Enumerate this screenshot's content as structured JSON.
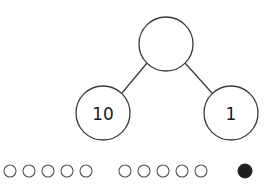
{
  "number_bond": {
    "whole": {
      "label": "",
      "cx": 166,
      "cy": 44,
      "r": 27
    },
    "parts": [
      {
        "label": "10",
        "cx": 103,
        "cy": 113,
        "r": 27
      },
      {
        "label": "1",
        "cx": 231,
        "cy": 113,
        "r": 27
      }
    ]
  },
  "counters": {
    "groups": [
      {
        "name": "ten-group-1",
        "count": 5,
        "filled": false,
        "centers_x": [
          10,
          29,
          48,
          67,
          86
        ]
      },
      {
        "name": "ten-group-2",
        "count": 5,
        "filled": false,
        "centers_x": [
          125,
          144,
          163,
          182,
          201
        ]
      },
      {
        "name": "one-group",
        "count": 1,
        "filled": true,
        "centers_x": [
          245
        ]
      }
    ],
    "cy": 171,
    "r_empty": 6,
    "r_filled": 7
  }
}
